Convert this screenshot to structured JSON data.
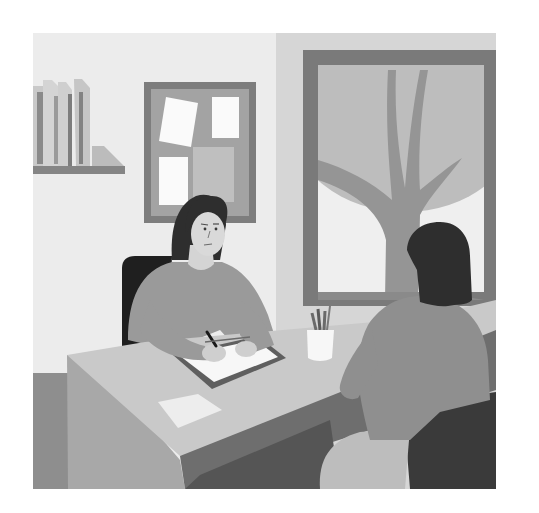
{
  "illustration": {
    "subject": "Two women at a desk in an office, one writing on a clipboard, one seen from behind",
    "style": "flat grayscale vector illustration",
    "canvas": {
      "width": 539,
      "height": 513,
      "background": "#ffffff"
    },
    "scene_bounds": {
      "x": 33,
      "y": 33,
      "width": 463,
      "height": 456
    },
    "colors": {
      "wall_left": "#ececec",
      "wall_right": "#d6d6d6",
      "frame_dark": "#7a7a7a",
      "window_pane": "#efefef",
      "tree_canopy": "#bdbdbd",
      "tree_trunk": "#959595",
      "cork_board": "#a3a3a3",
      "note_white": "#fafafa",
      "note_gray": "#bfbfbf",
      "shelf": "#858585",
      "book_light": "#d0d0d0",
      "book_dark": "#8a8a8a",
      "hair": "#2e2e2e",
      "skin": "#d9d9d9",
      "sweater": "#9a9a9a",
      "chair_dark": "#1f1f1f",
      "desk_top": "#c9c9c9",
      "desk_side": "#a8a8a8",
      "desk_front": "#6e6e6e",
      "desk_shadow": "#555555",
      "floor_left": "#8e8e8e",
      "clipboard": "#5f5f5f",
      "paper": "#f7f7f7",
      "cup": "#f7f7f7",
      "pencil": "#6a6a6a",
      "visitor_sweater": "#8f8f8f",
      "visitor_chair": "#3a3a3a",
      "visitor_legs": "#bdbdbd"
    },
    "elements": [
      "bookshelf-with-books",
      "bulletin-board-with-notes",
      "window-with-tree",
      "interviewer-woman-writing",
      "office-chair",
      "desk",
      "clipboard-with-paper",
      "pencil-cup",
      "loose-paper",
      "visitor-woman-from-behind",
      "visitor-chair"
    ]
  }
}
